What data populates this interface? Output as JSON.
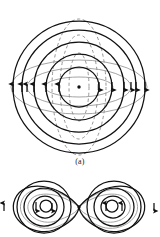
{
  "figure": {
    "caption_a": "(a)",
    "background_color": "#ffffff",
    "stroke_solid_color": "#111111",
    "stroke_dashed_color": "#8a8a8a",
    "stroke_gray_color": "#9a9a9a",
    "center_dot_color": "#111111",
    "panels": [
      {
        "id": "panel-a",
        "label": "(a)",
        "description": "concentric magnetic field circles with directional arrows, dashed vertical electric field loops and gray horizontal lens loops",
        "center": {
          "x": 79,
          "y": 87
        },
        "center_dot_radius": 1.6,
        "solid_circle_radii": [
          20,
          33,
          45,
          57,
          66
        ],
        "dashed_ellipse_rx": [
          10,
          19,
          27
        ],
        "dashed_ellipse_ry": [
          34,
          52,
          68
        ],
        "gray_ellipse_rx": [
          34,
          52,
          68
        ],
        "gray_ellipse_ry": [
          10,
          19,
          27
        ],
        "arrow_direction_left": "up",
        "arrow_direction_right": "down",
        "arrow_row_y": 87,
        "left_arrow_x": [
          13,
          22,
          27,
          34,
          46,
          59
        ],
        "right_arrow_x": [
          99,
          112,
          124,
          131,
          136,
          145
        ]
      },
      {
        "id": "panel-b",
        "label": "",
        "description": "two-lobe dipole pattern, left and right lobes of nested loops meeting at a central point",
        "center": {
          "x": 79,
          "y": 207
        },
        "center_dot_radius": 1.6,
        "lobe_left_center": {
          "x": 43,
          "y": 207
        },
        "lobe_right_center": {
          "x": 115,
          "y": 207
        },
        "lobe_solid_radii": [
          8,
          15,
          22,
          29
        ],
        "lobe_gray_radii": [
          19,
          26
        ],
        "left_lobe_arrow_direction": "counterclockwise",
        "right_lobe_arrow_direction": "clockwise"
      }
    ]
  }
}
